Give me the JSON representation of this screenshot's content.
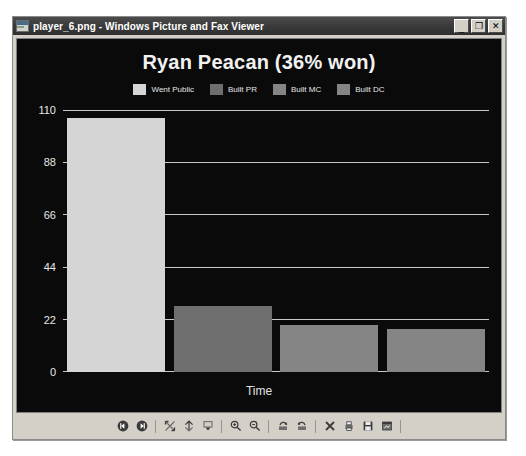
{
  "window": {
    "title": "player_6.png - Windows Picture and Fax Viewer",
    "title_icon": "image-file-icon",
    "buttons": {
      "minimize": "_",
      "maximize": "❐",
      "close": "✕"
    }
  },
  "colors": {
    "plot_background": "#0a0a0a",
    "gridline": "#c8c8c8",
    "text": "#f2f2f2",
    "series_went_public": "#d5d5d5",
    "series_built_pr": "#6e6e6e",
    "series_built_mc": "#858585",
    "series_built_dc": "#858585"
  },
  "chart_data": {
    "type": "bar",
    "title": "Ryan Peacan (36% won)",
    "xlabel": "Time",
    "ylabel": "",
    "categories": [
      "Went Public",
      "Built PR",
      "Built MC",
      "Built DC"
    ],
    "values": [
      107,
      28,
      20,
      18
    ],
    "ylim": [
      0,
      110
    ],
    "yticks": [
      0,
      22,
      44,
      66,
      88,
      110
    ],
    "ytick_labels": [
      "0",
      "22",
      "44",
      "66",
      "88",
      "110"
    ],
    "grid": true,
    "legend_position": "top",
    "legend": [
      {
        "label": "Went Public",
        "color": "#d5d5d5"
      },
      {
        "label": "Built PR",
        "color": "#6e6e6e"
      },
      {
        "label": "Built MC",
        "color": "#858585"
      },
      {
        "label": "Built DC",
        "color": "#858585"
      }
    ]
  },
  "toolbar": {
    "items": [
      {
        "name": "previous-image-button",
        "icon": "previous-image-icon"
      },
      {
        "name": "next-image-button",
        "icon": "next-image-icon"
      },
      {
        "name": "separator",
        "icon": "separator"
      },
      {
        "name": "best-fit-button",
        "icon": "best-fit-icon"
      },
      {
        "name": "actual-size-button",
        "icon": "actual-size-icon"
      },
      {
        "name": "start-slideshow-button",
        "icon": "slideshow-icon"
      },
      {
        "name": "separator",
        "icon": "separator"
      },
      {
        "name": "zoom-in-button",
        "icon": "zoom-in-icon"
      },
      {
        "name": "zoom-out-button",
        "icon": "zoom-out-icon"
      },
      {
        "name": "separator",
        "icon": "separator"
      },
      {
        "name": "rotate-clockwise-button",
        "icon": "rotate-clockwise-icon"
      },
      {
        "name": "rotate-counterclockwise-button",
        "icon": "rotate-counterclockwise-icon"
      },
      {
        "name": "separator",
        "icon": "separator"
      },
      {
        "name": "delete-button",
        "icon": "delete-icon"
      },
      {
        "name": "print-button",
        "icon": "print-icon"
      },
      {
        "name": "save-as-button",
        "icon": "save-icon"
      },
      {
        "name": "close-and-edit-button",
        "icon": "edit-image-icon"
      },
      {
        "name": "separator",
        "icon": "separator"
      },
      {
        "name": "help-button",
        "icon": "help-icon"
      }
    ]
  }
}
